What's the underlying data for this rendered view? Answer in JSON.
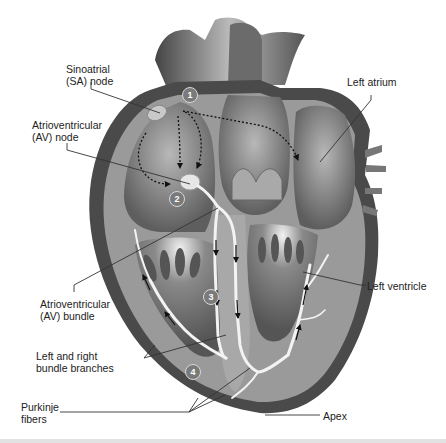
{
  "diagram": {
    "palette": {
      "background": "#ffffff",
      "outer_wall": "#4a4a4a",
      "wall": "#9a9a9a",
      "chamber": "#7d7d7d",
      "light": "#d9d9d9",
      "conduction_path": "#f2f2f2",
      "label_text": "#222222",
      "leader_line": "#333333",
      "step_badge": "#7a7a7a"
    },
    "labels": {
      "sa_node": [
        "Sinoatrial",
        "(SA) node"
      ],
      "av_node": [
        "Atrioventricular",
        "(AV) node"
      ],
      "av_bundle": [
        "Atrioventricular",
        "(AV) bundle"
      ],
      "bundle_branches": [
        "Left and right",
        "bundle branches"
      ],
      "purkinje": [
        "Purkinje",
        "fibers"
      ],
      "left_atrium": [
        "Left atrium"
      ],
      "left_ventricle": [
        "Left ventricle"
      ],
      "apex": [
        "Apex"
      ]
    },
    "steps": [
      {
        "number": "1",
        "refers_to": "SA node"
      },
      {
        "number": "2",
        "refers_to": "AV node"
      },
      {
        "number": "3",
        "refers_to": "AV bundle"
      },
      {
        "number": "4",
        "refers_to": "Bundle branches / Purkinje fibers"
      }
    ]
  }
}
